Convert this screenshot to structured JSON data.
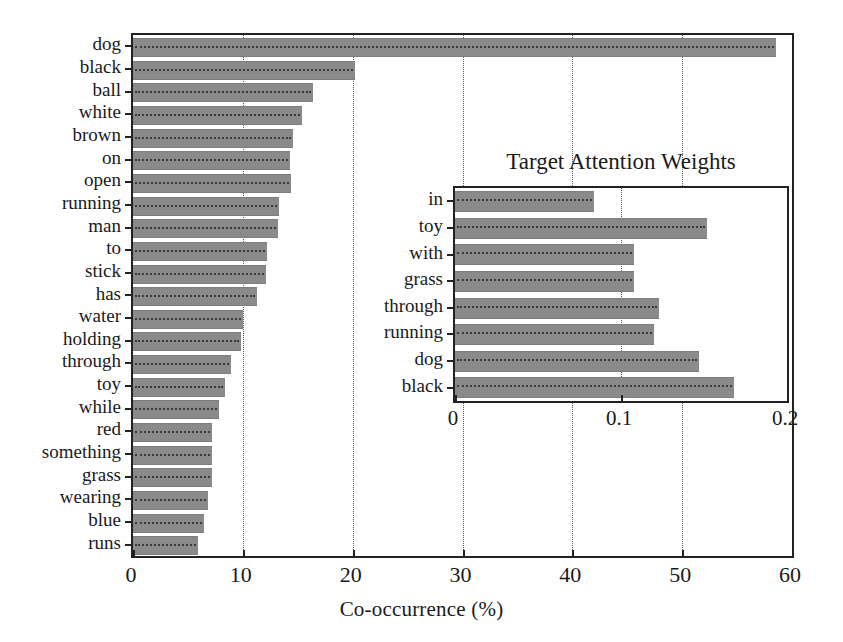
{
  "chart_data": [
    {
      "id": "main",
      "type": "bar",
      "orientation": "horizontal",
      "title": "",
      "xlabel": "Co-occurrence (%)",
      "ylabel": "",
      "xlim": [
        0,
        60
      ],
      "xticks": [
        0,
        10,
        20,
        30,
        40,
        50,
        60
      ],
      "xticklabels": [
        "0",
        "10",
        "20",
        "30",
        "40",
        "50",
        "60"
      ],
      "grid": "vertical-dotted",
      "legend": "none",
      "bar_color": "#8a8a8a",
      "categories": [
        "dog",
        "black",
        "ball",
        "white",
        "brown",
        "on",
        "open",
        "running",
        "man",
        "to",
        "stick",
        "has",
        "water",
        "holding",
        "through",
        "toy",
        "while",
        "red",
        "something",
        "grass",
        "wearing",
        "blue",
        "runs"
      ],
      "values": [
        58.5,
        20.2,
        16.4,
        15.4,
        14.6,
        14.3,
        14.4,
        13.3,
        13.2,
        12.2,
        12.1,
        11.3,
        10.0,
        9.8,
        8.9,
        8.4,
        7.8,
        7.2,
        7.2,
        7.2,
        6.8,
        6.5,
        5.9
      ]
    },
    {
      "id": "inset",
      "type": "bar",
      "orientation": "horizontal",
      "title": "Target Attention Weights",
      "xlabel": "",
      "ylabel": "",
      "xlim": [
        0,
        0.2
      ],
      "xticks": [
        0,
        0.1,
        0.2
      ],
      "xticklabels": [
        "0",
        "0.1",
        "0.2"
      ],
      "grid": "vertical-dotted",
      "legend": "none",
      "bar_color": "#8a8a8a",
      "categories": [
        "in",
        "toy",
        "with",
        "grass",
        "through",
        "running",
        "dog",
        "black"
      ],
      "values": [
        0.084,
        0.152,
        0.108,
        0.108,
        0.123,
        0.12,
        0.147,
        0.168
      ]
    }
  ]
}
